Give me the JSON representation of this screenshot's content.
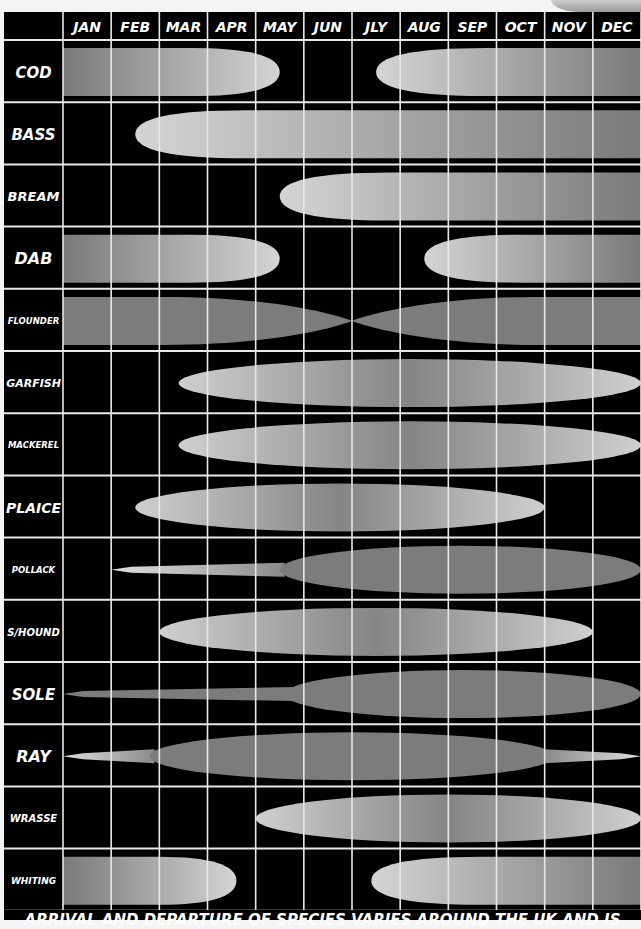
{
  "chart_data": {
    "type": "table",
    "title": "",
    "subtitle": "",
    "xlabel": "Month",
    "ylabel": "Species",
    "categories": [
      "JAN",
      "FEB",
      "MAR",
      "APR",
      "MAY",
      "JUN",
      "JLY",
      "AUG",
      "SEP",
      "OCT",
      "NOV",
      "DEC"
    ],
    "legend": [],
    "grid": true,
    "note": "ARRIVAL AND DEPARTURE OF SPECIES VARIES AROUND THE UK AND IS",
    "series": [
      {
        "name": "COD",
        "bands": [
          {
            "start": 0.0,
            "end": 4.5,
            "shape": "taper-right",
            "tone": "light"
          },
          {
            "start": 6.5,
            "end": 12.0,
            "shape": "taper-left",
            "tone": "light"
          }
        ]
      },
      {
        "name": "BASS",
        "bands": [
          {
            "start": 1.5,
            "end": 12.0,
            "shape": "taper-left",
            "tone": "light"
          }
        ]
      },
      {
        "name": "BREAM",
        "bands": [
          {
            "start": 4.5,
            "end": 12.0,
            "shape": "taper-left",
            "tone": "light"
          }
        ]
      },
      {
        "name": "DAB",
        "bands": [
          {
            "start": 0.0,
            "end": 4.5,
            "shape": "taper-right",
            "tone": "light"
          },
          {
            "start": 7.5,
            "end": 12.0,
            "shape": "taper-left",
            "tone": "light"
          }
        ]
      },
      {
        "name": "FLOUNDER",
        "bands": [
          {
            "start": 0.0,
            "end": 6.0,
            "shape": "taper-right",
            "tone": "dark"
          },
          {
            "start": 6.0,
            "end": 12.0,
            "shape": "taper-left",
            "tone": "dark"
          }
        ]
      },
      {
        "name": "GARFISH",
        "bands": [
          {
            "start": 2.4,
            "end": 12.0,
            "shape": "ellipse",
            "tone": "light"
          }
        ]
      },
      {
        "name": "MACKEREL",
        "bands": [
          {
            "start": 2.4,
            "end": 12.0,
            "shape": "ellipse",
            "tone": "light"
          }
        ]
      },
      {
        "name": "PLAICE",
        "bands": [
          {
            "start": 1.5,
            "end": 10.0,
            "shape": "ellipse",
            "tone": "light"
          }
        ]
      },
      {
        "name": "POLLACK",
        "bands": [
          {
            "start": 1.0,
            "end": 4.6,
            "shape": "thin",
            "tone": "light"
          },
          {
            "start": 4.5,
            "end": 12.0,
            "shape": "ellipse",
            "tone": "dark"
          }
        ]
      },
      {
        "name": "S/HOUND",
        "bands": [
          {
            "start": 2.0,
            "end": 11.0,
            "shape": "ellipse",
            "tone": "light"
          }
        ]
      },
      {
        "name": "SOLE",
        "bands": [
          {
            "start": 0.0,
            "end": 4.8,
            "shape": "thin",
            "tone": "dark"
          },
          {
            "start": 4.6,
            "end": 12.0,
            "shape": "ellipse",
            "tone": "dark"
          }
        ]
      },
      {
        "name": "RAY",
        "bands": [
          {
            "start": 0.0,
            "end": 1.9,
            "shape": "thin",
            "tone": "light"
          },
          {
            "start": 1.8,
            "end": 10.2,
            "shape": "ellipse",
            "tone": "dark"
          },
          {
            "start": 10.0,
            "end": 12.0,
            "shape": "thin",
            "tone": "light"
          }
        ]
      },
      {
        "name": "WRASSE",
        "bands": [
          {
            "start": 4.0,
            "end": 12.0,
            "shape": "ellipse",
            "tone": "light"
          }
        ]
      },
      {
        "name": "WHITING",
        "bands": [
          {
            "start": 0.0,
            "end": 3.6,
            "shape": "taper-right",
            "tone": "light"
          },
          {
            "start": 6.4,
            "end": 12.0,
            "shape": "taper-left",
            "tone": "light"
          }
        ]
      }
    ]
  },
  "header": {
    "months": [
      "JAN",
      "FEB",
      "MAR",
      "APR",
      "MAY",
      "JUN",
      "JLY",
      "AUG",
      "SEP",
      "OCT",
      "NOV",
      "DEC"
    ]
  },
  "species": [
    "COD",
    "BASS",
    "BREAM",
    "DAB",
    "FLOUNDER",
    "GARFISH",
    "MACKEREL",
    "PLAICE",
    "POLLACK",
    "S/HOUND",
    "SOLE",
    "RAY",
    "WRASSE",
    "WHITING"
  ],
  "footer": {
    "note": "ARRIVAL AND DEPARTURE OF SPECIES VARIES AROUND THE UK AND IS"
  },
  "colors": {
    "background": "#000000",
    "grid": "#e8e8e8",
    "text": "#ffffff",
    "band_light_edge": "#c8c8c8",
    "band_light_mid": "#8a8a8a",
    "band_dark": "#7c7c7c"
  }
}
